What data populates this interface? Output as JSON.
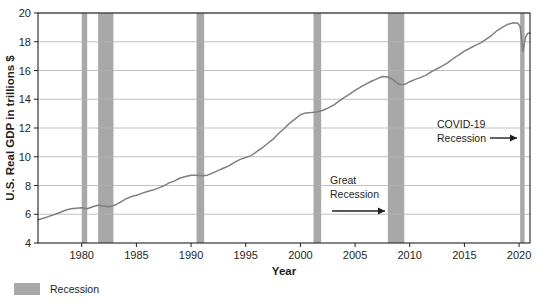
{
  "chart_data": {
    "type": "line",
    "title": "",
    "xlabel": "Year",
    "ylabel": "U.S. Real GDP in trillions $",
    "xlim": [
      1976,
      2021
    ],
    "ylim": [
      4,
      20
    ],
    "grid": true,
    "legend_position": "below-left",
    "x_ticks": [
      "1980",
      "1985",
      "1990",
      "1995",
      "2000",
      "2005",
      "2010",
      "2015",
      "2020"
    ],
    "x_tick_values": [
      1980,
      1985,
      1990,
      1995,
      2000,
      2005,
      2010,
      2015,
      2020
    ],
    "y_ticks": [
      "4",
      "6",
      "8",
      "10",
      "12",
      "14",
      "16",
      "18",
      "20"
    ],
    "y_tick_values": [
      4,
      6,
      8,
      10,
      12,
      14,
      16,
      18,
      20
    ],
    "series": [
      {
        "name": "U.S. Real GDP",
        "color": "#7f7f7f",
        "x": [
          1976.0,
          1976.5,
          1977.0,
          1977.5,
          1978.0,
          1978.5,
          1979.0,
          1979.5,
          1980.0,
          1980.5,
          1981.0,
          1981.5,
          1982.0,
          1982.5,
          1983.0,
          1983.5,
          1984.0,
          1984.5,
          1985.0,
          1985.5,
          1986.0,
          1986.5,
          1987.0,
          1987.5,
          1988.0,
          1988.5,
          1989.0,
          1989.5,
          1990.0,
          1990.5,
          1991.0,
          1991.5,
          1992.0,
          1992.5,
          1993.0,
          1993.5,
          1994.0,
          1994.5,
          1995.0,
          1995.5,
          1996.0,
          1996.5,
          1997.0,
          1997.5,
          1998.0,
          1998.5,
          1999.0,
          1999.5,
          2000.0,
          2000.5,
          2001.0,
          2001.5,
          2002.0,
          2002.5,
          2003.0,
          2003.5,
          2004.0,
          2004.5,
          2005.0,
          2005.5,
          2006.0,
          2006.5,
          2007.0,
          2007.5,
          2008.0,
          2008.5,
          2009.0,
          2009.5,
          2010.0,
          2010.5,
          2011.0,
          2011.5,
          2012.0,
          2012.5,
          2013.0,
          2013.5,
          2014.0,
          2014.5,
          2015.0,
          2015.5,
          2016.0,
          2016.5,
          2017.0,
          2017.5,
          2018.0,
          2018.5,
          2019.0,
          2019.5,
          2019.9,
          2020.1,
          2020.35,
          2020.6,
          2020.8,
          2021.0
        ],
        "y": [
          5.62,
          5.72,
          5.85,
          5.98,
          6.12,
          6.28,
          6.38,
          6.42,
          6.45,
          6.38,
          6.52,
          6.62,
          6.58,
          6.52,
          6.62,
          6.82,
          7.05,
          7.22,
          7.32,
          7.45,
          7.58,
          7.68,
          7.82,
          7.98,
          8.18,
          8.32,
          8.52,
          8.62,
          8.72,
          8.72,
          8.68,
          8.72,
          8.88,
          9.05,
          9.22,
          9.38,
          9.62,
          9.82,
          9.95,
          10.08,
          10.35,
          10.62,
          10.92,
          11.22,
          11.62,
          11.95,
          12.32,
          12.62,
          12.92,
          13.05,
          13.08,
          13.12,
          13.22,
          13.38,
          13.58,
          13.85,
          14.12,
          14.35,
          14.62,
          14.85,
          15.05,
          15.25,
          15.42,
          15.58,
          15.55,
          15.35,
          15.05,
          15.02,
          15.22,
          15.38,
          15.52,
          15.68,
          15.92,
          16.12,
          16.32,
          16.55,
          16.85,
          17.08,
          17.35,
          17.55,
          17.75,
          17.92,
          18.18,
          18.45,
          18.78,
          19.02,
          19.22,
          19.32,
          19.28,
          19.05,
          17.32,
          18.35,
          18.58,
          18.62
        ]
      }
    ],
    "recession_bands": [
      {
        "label": "1980 recession",
        "start": 1980.0,
        "end": 1980.5
      },
      {
        "label": "1981-82 recession",
        "start": 1981.5,
        "end": 1982.9
      },
      {
        "label": "1990-91 recession",
        "start": 1990.5,
        "end": 1991.2
      },
      {
        "label": "2001 recession",
        "start": 2001.2,
        "end": 2001.9
      },
      {
        "label": "2007-09 Great Recession",
        "start": 2008.0,
        "end": 2009.5
      },
      {
        "label": "2020 COVID-19 recession",
        "start": 2020.1,
        "end": 2020.5
      }
    ],
    "annotations": [
      {
        "id": "great-recession",
        "lines": [
          "Great",
          "Recession"
        ],
        "arrow": "right"
      },
      {
        "id": "covid-recession",
        "lines": [
          "COVID-19",
          "Recession"
        ],
        "arrow": "right"
      }
    ],
    "legend": [
      {
        "label": "Recession",
        "color": "#a8a8a8",
        "type": "swatch"
      }
    ],
    "colors": {
      "line": "#7f7f7f",
      "recession_band": "#a8a8a8",
      "grid": "#b3b3b3",
      "axis": "#231f20",
      "text": "#231f20",
      "background": "#ffffff"
    }
  }
}
